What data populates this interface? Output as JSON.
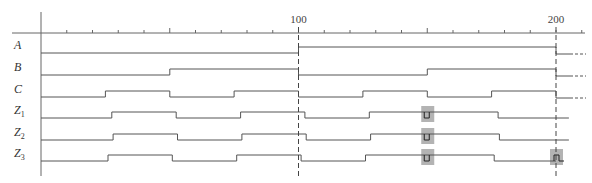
{
  "diagram": {
    "axis": {
      "t_min": 0,
      "t_max": 205,
      "minor_tick_step": 10,
      "major_ticks": [
        50,
        150
      ],
      "labeled_ticks": [
        {
          "t": 100,
          "label": "100"
        },
        {
          "t": 200,
          "label": "200"
        }
      ],
      "dashed_markers": [
        100,
        200
      ]
    },
    "signals": [
      {
        "id": "A",
        "name": "A",
        "sub": "",
        "start": 0,
        "edges": [
          100
        ],
        "end_t": 200,
        "after": "undefined"
      },
      {
        "id": "B",
        "name": "B",
        "sub": "",
        "start": 0,
        "edges": [
          50,
          100,
          150
        ],
        "end_t": 200,
        "after": "undefined"
      },
      {
        "id": "C",
        "name": "C",
        "sub": "",
        "start": 0,
        "edges": [
          25,
          50,
          75,
          100,
          125,
          150,
          175
        ],
        "end_t": 200,
        "after": "undefined"
      },
      {
        "id": "Z1",
        "name": "Z",
        "sub": "1",
        "start": 0,
        "edges": [
          27.5,
          52.5,
          77.5,
          102.5,
          127.5,
          177.5
        ],
        "glitches": [
          {
            "t": 150,
            "dir": "low"
          }
        ],
        "end_t": 205,
        "after": "none"
      },
      {
        "id": "Z2",
        "name": "Z",
        "sub": "2",
        "start": 0,
        "edges": [
          28,
          53,
          78,
          103,
          128,
          178
        ],
        "glitches": [
          {
            "t": 150,
            "dir": "low"
          }
        ],
        "end_t": 205,
        "after": "none"
      },
      {
        "id": "Z3",
        "name": "Z",
        "sub": "3",
        "start": 0,
        "edges": [
          26,
          51,
          76,
          101,
          126,
          176
        ],
        "glitches": [
          {
            "t": 150,
            "dir": "low"
          },
          {
            "t": 200,
            "dir": "high"
          }
        ],
        "end_t": 200,
        "after": "none"
      }
    ],
    "colors": {
      "line": "#555555",
      "axis": "#666666",
      "highlight": "#b3b3b3"
    }
  }
}
